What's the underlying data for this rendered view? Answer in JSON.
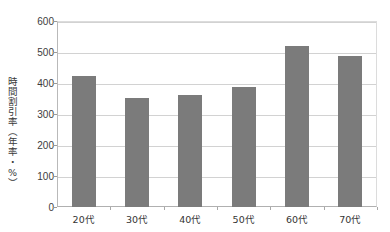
{
  "chart_data": {
    "type": "bar",
    "title": "",
    "subtitle": "",
    "xlabel": "",
    "ylabel": "時間割引率（年率・%）",
    "categories": [
      "20代",
      "30代",
      "40代",
      "50代",
      "60代",
      "70代"
    ],
    "values": [
      422,
      352,
      362,
      388,
      519,
      487
    ],
    "series": [
      {
        "name": "時間割引率",
        "values": [
          422,
          352,
          362,
          388,
          519,
          487
        ]
      }
    ],
    "ylim": [
      0,
      600
    ],
    "ytick_labels": [
      "0",
      "100",
      "200",
      "300",
      "400",
      "500",
      "600"
    ],
    "ytick_values": [
      0,
      100,
      200,
      300,
      400,
      500,
      600
    ],
    "grid": true,
    "legend": false,
    "legend_position": "none",
    "bar_color": "#7b7b7b",
    "background_color": "#ffffff",
    "gridline_color": "#d2d2d2",
    "axis_color": "#b0b0b0"
  }
}
